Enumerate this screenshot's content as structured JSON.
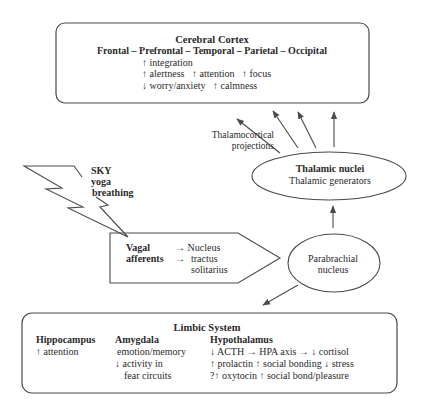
{
  "colors": {
    "stroke": "#4a4a4a",
    "text": "#2a2a2a",
    "background": "#ffffff"
  },
  "cortex": {
    "title": "Cerebral Cortex",
    "regions": "Frontal – Prefrontal – Temporal – Parietal – Occipital",
    "effects": [
      "↑ integration",
      "↑ alertness   ↑ attention   ↑ focus",
      "↓ worry/anxiety   ↑ calmness"
    ]
  },
  "projections": {
    "line1": "Thalamocortical",
    "line2": "projections"
  },
  "sky": {
    "line1": "SKY",
    "line2": "yoga",
    "line3": "breathing"
  },
  "thalamic": {
    "title": "Thalamic nuclei",
    "subtitle": "Thalamic generators"
  },
  "vagal": {
    "label1": "Vagal",
    "label2": "afferents",
    "arrow1": "→ Nucleus",
    "arrow2": "→",
    "target1": "tractus",
    "target2": "solitarius"
  },
  "parabrachial": {
    "line1": "Parabrachial",
    "line2": "nucleus"
  },
  "limbic": {
    "title": "Limbic System",
    "columns": [
      {
        "heading": "Hippocampus",
        "lines": [
          "↑ attention"
        ]
      },
      {
        "heading": "Amygdala",
        "lines": [
          "emotion/memory",
          "↓ activity in",
          "fear circuits"
        ]
      },
      {
        "heading": "Hypothalamus",
        "lines": [
          "↓ ACTH → HPA axis → ↓ cortisol",
          "↑ prolactin ↑ social bonding ↓ stress",
          "?↑ oxytocin ↑ social bond/pleasure"
        ]
      }
    ]
  }
}
